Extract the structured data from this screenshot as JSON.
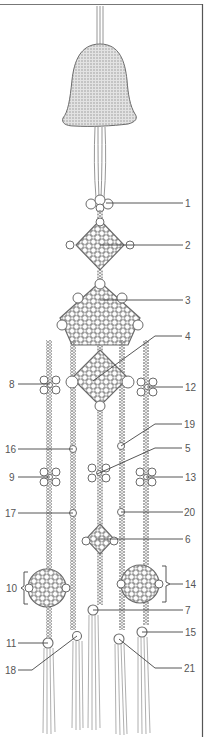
{
  "figure": {
    "colors": {
      "line": "#6b6b6b",
      "cord": "#8a8a8a",
      "bell_fill": "#d9d9d9",
      "bell_dot": "#9a9a9a",
      "label": "#555555",
      "frame": "#555555"
    },
    "labels": [
      {
        "id": "1",
        "text": "1",
        "side": "right"
      },
      {
        "id": "2",
        "text": "2",
        "side": "right"
      },
      {
        "id": "3",
        "text": "3",
        "side": "right"
      },
      {
        "id": "4",
        "text": "4",
        "side": "right"
      },
      {
        "id": "5",
        "text": "5",
        "side": "right"
      },
      {
        "id": "6",
        "text": "6",
        "side": "right"
      },
      {
        "id": "7",
        "text": "7",
        "side": "right"
      },
      {
        "id": "8",
        "text": "8",
        "side": "left"
      },
      {
        "id": "9",
        "text": "9",
        "side": "left"
      },
      {
        "id": "10",
        "text": "10",
        "side": "left"
      },
      {
        "id": "11",
        "text": "11",
        "side": "left"
      },
      {
        "id": "12",
        "text": "12",
        "side": "right"
      },
      {
        "id": "13",
        "text": "13",
        "side": "right"
      },
      {
        "id": "14",
        "text": "14",
        "side": "right"
      },
      {
        "id": "15",
        "text": "15",
        "side": "right"
      },
      {
        "id": "16",
        "text": "16",
        "side": "left"
      },
      {
        "id": "17",
        "text": "17",
        "side": "left"
      },
      {
        "id": "18",
        "text": "18",
        "side": "left"
      },
      {
        "id": "19",
        "text": "19",
        "side": "right"
      },
      {
        "id": "20",
        "text": "20",
        "side": "right"
      },
      {
        "id": "21",
        "text": "21",
        "side": "right"
      }
    ],
    "parts": {
      "bell": "stippled-bell",
      "top_knot": "cloud-knot",
      "diamond_knot": "diamond-knot",
      "large_knot": "large-plafond-knot",
      "center_knot": "center-square-knot",
      "flower_knots": "butterfly-knots",
      "bead_knots": "button-knots",
      "round_knots": "round-knots",
      "tassels": "tassel-fringes"
    }
  }
}
